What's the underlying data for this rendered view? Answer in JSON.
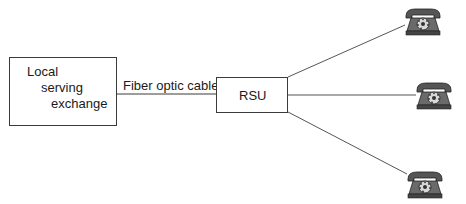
{
  "diagram": {
    "nodes": {
      "local_exchange": {
        "lines": [
          "Local",
          "serving",
          "exchange"
        ]
      },
      "rsu": {
        "label": "RSU"
      }
    },
    "edges": {
      "fiber": {
        "label": "Fiber optic cable"
      }
    },
    "phones": [
      {
        "icon": "telephone-icon"
      },
      {
        "icon": "telephone-icon"
      },
      {
        "icon": "telephone-icon"
      }
    ]
  }
}
